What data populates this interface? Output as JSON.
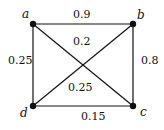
{
  "graph": {
    "nodes": [
      {
        "id": "a",
        "label": "a",
        "x": 33,
        "y": 24
      },
      {
        "id": "b",
        "label": "b",
        "x": 133,
        "y": 24
      },
      {
        "id": "c",
        "label": "c",
        "x": 133,
        "y": 106
      },
      {
        "id": "d",
        "label": "d",
        "x": 33,
        "y": 106
      }
    ],
    "edges": [
      {
        "from": "a",
        "to": "b",
        "weight": "0.9"
      },
      {
        "from": "b",
        "to": "c",
        "weight": "0.8"
      },
      {
        "from": "c",
        "to": "d",
        "weight": "0.15"
      },
      {
        "from": "d",
        "to": "a",
        "weight": "0.25"
      },
      {
        "from": "b",
        "to": "d",
        "weight": "0.2"
      },
      {
        "from": "a",
        "to": "c",
        "weight": "0.25"
      }
    ]
  }
}
